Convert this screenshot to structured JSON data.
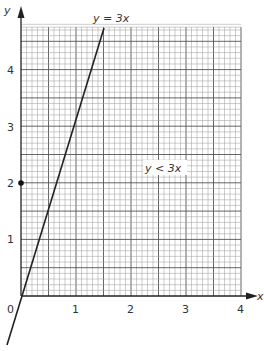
{
  "chart_data": {
    "type": "line",
    "title": "",
    "xlabel": "x",
    "ylabel": "y",
    "xlim": [
      0,
      4
    ],
    "ylim": [
      0,
      4.75
    ],
    "x_ticks": [
      "0",
      "1",
      "2",
      "3",
      "4"
    ],
    "y_ticks": [
      "1",
      "2",
      "3",
      "4"
    ],
    "grid": true,
    "grid_minor_step": 0.1,
    "grid_major_step": 0.5,
    "series": [
      {
        "name": "y = 3x",
        "equation": "y = 3x",
        "x": [
          -0.25,
          1.5833
        ],
        "y": [
          -0.75,
          4.75
        ]
      }
    ],
    "points": [
      {
        "x": 0,
        "y": 2,
        "style": "filled-dot"
      }
    ],
    "annotations": [
      {
        "text": "y = 3x",
        "x": 1.45,
        "y": 5.0
      },
      {
        "text": "y < 3x",
        "x": 2.6,
        "y": 2.3
      }
    ],
    "origin_label": "0"
  },
  "labels": {
    "line": "y = 3x",
    "region": "y < 3x",
    "x_axis": "x",
    "y_axis": "y",
    "origin": "0",
    "x1": "1",
    "x2": "2",
    "x3": "3",
    "x4": "4",
    "y1": "1",
    "y2": "2",
    "y3": "3",
    "y4": "4"
  },
  "colors": {
    "line": "#222222",
    "grid_minor": "#9a9a9a",
    "grid_major": "#555555",
    "axis": "#222222",
    "text": "#333333"
  }
}
